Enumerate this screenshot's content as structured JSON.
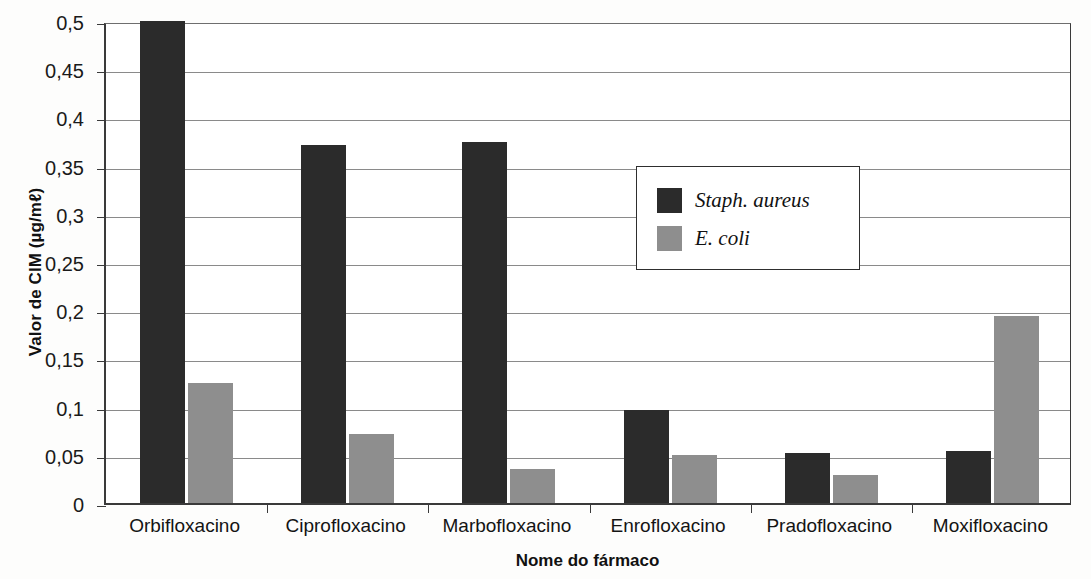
{
  "chart_data": {
    "type": "bar",
    "title": "",
    "xlabel": "Nome do fármaco",
    "ylabel": "Valor de CIM (µg/mℓ)",
    "categories": [
      "Orbifloxacino",
      "Ciprofloxacino",
      "Marbofloxacino",
      "Enrofloxacino",
      "Pradofloxacino",
      "Moxifloxacino"
    ],
    "series": [
      {
        "name": "Staph. aureus",
        "color": "#2b2b2b",
        "values": [
          0.5,
          0.371,
          0.374,
          0.097,
          0.052,
          0.054
        ]
      },
      {
        "name": "E. coli",
        "color": "#8e8e8e",
        "values": [
          0.125,
          0.072,
          0.035,
          0.05,
          0.029,
          0.194
        ]
      }
    ],
    "ylim": [
      0,
      0.5
    ],
    "yticks": [
      0,
      0.05,
      0.1,
      0.15,
      0.2,
      0.25,
      0.3,
      0.35,
      0.4,
      0.45,
      0.5
    ],
    "ytick_labels": [
      "0",
      "0,05",
      "0,1",
      "0,15",
      "0,2",
      "0,25",
      "0,3",
      "0,35",
      "0,4",
      "0,45",
      "0,5"
    ],
    "grid": true,
    "legend_position": "center-right"
  }
}
